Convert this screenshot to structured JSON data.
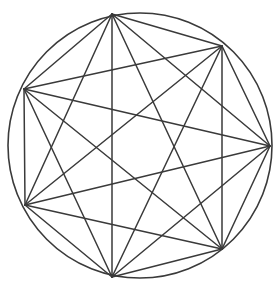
{
  "figure": {
    "type": "graph-diagram",
    "background_color": "#ffffff",
    "stroke_color": "#3a3a3a",
    "circle_stroke_width": 1.6,
    "edge_stroke_width": 1.5
  },
  "canvas": {
    "width": 280,
    "height": 281
  },
  "circle": {
    "label": "circumscribing-circle",
    "cx": 140,
    "cy": 145.5,
    "rx": 132,
    "ry": 132.5
  },
  "graph": {
    "name": "K7",
    "vertex_count": 7,
    "edge_count": 21,
    "degree_per_vertex": 6,
    "vertices": [
      {
        "id": "v1",
        "label": "top",
        "x": 112,
        "y": 14
      },
      {
        "id": "v2",
        "label": "upper-right",
        "x": 222,
        "y": 46
      },
      {
        "id": "v3",
        "label": "right",
        "x": 270,
        "y": 146
      },
      {
        "id": "v4",
        "label": "lower-right",
        "x": 222,
        "y": 249
      },
      {
        "id": "v5",
        "label": "bottom",
        "x": 112,
        "y": 277
      },
      {
        "id": "v6",
        "label": "lower-left",
        "x": 25,
        "y": 205
      },
      {
        "id": "v7",
        "label": "upper-left",
        "x": 24,
        "y": 89
      }
    ],
    "edges": [
      {
        "from": "v1",
        "to": "v2"
      },
      {
        "from": "v1",
        "to": "v3"
      },
      {
        "from": "v1",
        "to": "v4"
      },
      {
        "from": "v1",
        "to": "v5"
      },
      {
        "from": "v1",
        "to": "v6"
      },
      {
        "from": "v1",
        "to": "v7"
      },
      {
        "from": "v2",
        "to": "v3"
      },
      {
        "from": "v2",
        "to": "v4"
      },
      {
        "from": "v2",
        "to": "v5"
      },
      {
        "from": "v2",
        "to": "v6"
      },
      {
        "from": "v2",
        "to": "v7"
      },
      {
        "from": "v3",
        "to": "v4"
      },
      {
        "from": "v3",
        "to": "v5"
      },
      {
        "from": "v3",
        "to": "v6"
      },
      {
        "from": "v3",
        "to": "v7"
      },
      {
        "from": "v4",
        "to": "v5"
      },
      {
        "from": "v4",
        "to": "v6"
      },
      {
        "from": "v4",
        "to": "v7"
      },
      {
        "from": "v5",
        "to": "v6"
      },
      {
        "from": "v5",
        "to": "v7"
      },
      {
        "from": "v6",
        "to": "v7"
      }
    ]
  }
}
